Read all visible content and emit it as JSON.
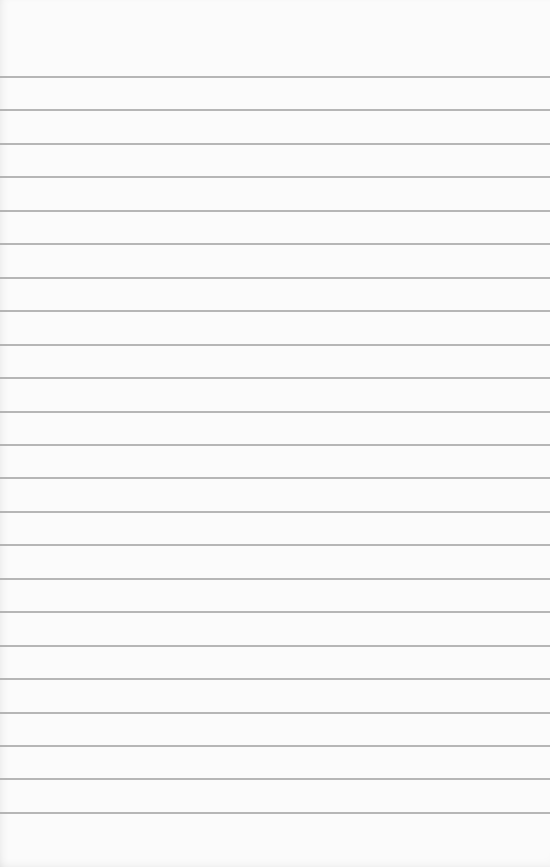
{
  "paper": {
    "type": "lined-paper",
    "background_color": "#fbfbfb",
    "rule_color": "#a9a9a9",
    "rule_count": 23,
    "first_rule_y": 76,
    "rule_spacing": 33.45
  }
}
